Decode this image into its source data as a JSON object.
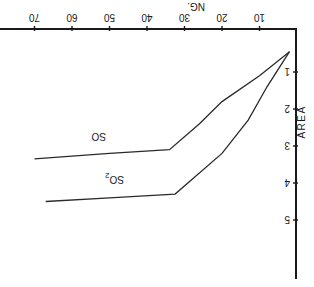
{
  "chart_data": {
    "type": "line",
    "title": "",
    "orientation_note": "image is rotated 180 degrees",
    "xlabel": "NG.",
    "ylabel": "AREA",
    "xlim": [
      0,
      75
    ],
    "ylim": [
      0,
      6.5
    ],
    "xticks": [
      10,
      20,
      30,
      40,
      50,
      60,
      70
    ],
    "yticks": [
      1,
      2,
      3,
      4,
      5
    ],
    "grid": false,
    "legend": "inline labels on curves",
    "series": [
      {
        "name": "SO",
        "label": "SO",
        "points": [
          [
            2,
            0.45
          ],
          [
            10,
            1.1
          ],
          [
            20,
            1.8
          ],
          [
            26,
            2.4
          ],
          [
            34,
            3.1
          ],
          [
            50,
            3.2
          ],
          [
            70,
            3.35
          ]
        ]
      },
      {
        "name": "SO2",
        "label": "SO2",
        "points": [
          [
            2,
            0.45
          ],
          [
            8,
            1.4
          ],
          [
            13,
            2.3
          ],
          [
            20,
            3.2
          ],
          [
            32.5,
            4.3
          ],
          [
            50,
            4.4
          ],
          [
            67,
            4.5
          ]
        ]
      }
    ]
  },
  "labels": {
    "x_axis": "NG.",
    "y_axis": "AREA",
    "so": "SO",
    "so2_base": "SO",
    "so2_sub": "2"
  }
}
